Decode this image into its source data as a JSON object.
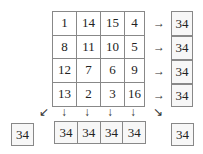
{
  "square": {
    "rows": [
      [
        "1",
        "14",
        "15",
        "4"
      ],
      [
        "8",
        "11",
        "10",
        "5"
      ],
      [
        "12",
        "7",
        "6",
        "9"
      ],
      [
        "13",
        "2",
        "3",
        "16"
      ]
    ]
  },
  "row_sums": [
    "34",
    "34",
    "34",
    "34"
  ],
  "col_sums": [
    "34",
    "34",
    "34",
    "34"
  ],
  "diag_sums": {
    "anti": "34",
    "main": "34"
  },
  "arrows": {
    "right": "→",
    "down": "↓",
    "down_left": "↙",
    "down_right": "↘"
  }
}
